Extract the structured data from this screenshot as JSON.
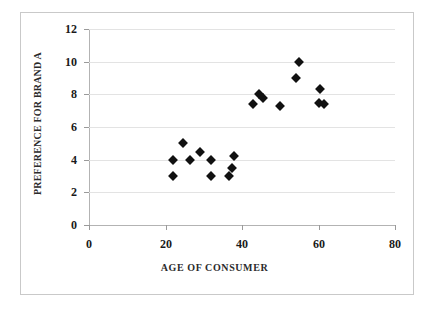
{
  "chart_data": {
    "type": "scatter",
    "title": "",
    "xlabel": "AGE OF CONSUMER",
    "ylabel": "PREFERENCE FOR BRAND A",
    "xlim": [
      0,
      80
    ],
    "ylim": [
      0,
      12
    ],
    "xticks": [
      0,
      20,
      40,
      60,
      80
    ],
    "yticks": [
      0,
      2,
      4,
      6,
      8,
      10,
      12
    ],
    "grid": "horizontal",
    "legend": "none",
    "marker": "diamond",
    "marker_color": "#111111",
    "points": [
      {
        "x": 22,
        "y": 4.0
      },
      {
        "x": 22,
        "y": 3.0
      },
      {
        "x": 24.5,
        "y": 5.0
      },
      {
        "x": 26.5,
        "y": 4.0
      },
      {
        "x": 29,
        "y": 4.5
      },
      {
        "x": 32,
        "y": 4.0
      },
      {
        "x": 32,
        "y": 3.0
      },
      {
        "x": 36.5,
        "y": 3.0
      },
      {
        "x": 37.5,
        "y": 3.5
      },
      {
        "x": 38,
        "y": 4.2
      },
      {
        "x": 43,
        "y": 7.4
      },
      {
        "x": 44.5,
        "y": 8.0
      },
      {
        "x": 45.5,
        "y": 7.8
      },
      {
        "x": 50,
        "y": 7.3
      },
      {
        "x": 55,
        "y": 10.0
      },
      {
        "x": 54,
        "y": 9.0
      },
      {
        "x": 60.5,
        "y": 8.3
      },
      {
        "x": 60,
        "y": 7.5
      },
      {
        "x": 61.5,
        "y": 7.4
      }
    ]
  },
  "axes": {
    "y_tick_labels": [
      "12",
      "10",
      "8",
      "6",
      "4",
      "2",
      "0"
    ],
    "x_tick_labels": [
      "0",
      "20",
      "40",
      "60",
      "80"
    ]
  }
}
